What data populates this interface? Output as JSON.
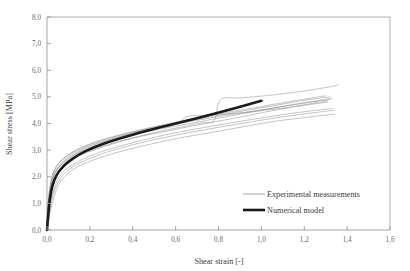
{
  "chart_data": {
    "type": "line",
    "title": "",
    "xlabel": "Shear strain [-]",
    "ylabel": "Shear stress [MPa]",
    "xlim": [
      0.0,
      1.6
    ],
    "ylim": [
      0.0,
      8.0
    ],
    "xticks": [
      0.0,
      0.2,
      0.4,
      0.6,
      0.8,
      1.0,
      1.2,
      1.4,
      1.6
    ],
    "yticks": [
      0.0,
      1.0,
      2.0,
      3.0,
      4.0,
      5.0,
      6.0,
      7.0,
      8.0
    ],
    "xtick_labels": [
      "0,0",
      "0,2",
      "0,4",
      "0,6",
      "0,8",
      "1,0",
      "1,2",
      "1,4",
      "1,6"
    ],
    "ytick_labels": [
      "0,0",
      "1,0",
      "2,0",
      "3,0",
      "4,0",
      "5,0",
      "6,0",
      "7,0",
      "8,0"
    ],
    "grid": false,
    "legend_position": "inside-lower-right",
    "decimal_separator": ",",
    "series": [
      {
        "name": "Experimental measurements",
        "style": "thin",
        "color": "#808080",
        "width": 0.6,
        "curves": [
          {
            "id": "exp-1",
            "x": [
              0.0,
              0.004,
              0.01,
              0.02,
              0.035,
              0.06,
              0.1,
              0.16,
              0.25,
              0.38,
              0.52,
              0.68,
              0.84,
              1.0,
              1.14,
              1.26,
              1.33
            ],
            "y": [
              0.0,
              0.55,
              1.15,
              1.7,
              2.1,
              2.4,
              2.68,
              2.95,
              3.22,
              3.52,
              3.78,
              4.02,
              4.26,
              4.5,
              4.7,
              4.86,
              4.95
            ]
          },
          {
            "id": "exp-2",
            "x": [
              0.0,
              0.005,
              0.012,
              0.024,
              0.042,
              0.07,
              0.11,
              0.17,
              0.27,
              0.4,
              0.55,
              0.7,
              0.86,
              1.0,
              1.13,
              1.24,
              1.31
            ],
            "y": [
              0.0,
              0.5,
              1.05,
              1.6,
              2.0,
              2.3,
              2.58,
              2.86,
              3.14,
              3.45,
              3.7,
              3.94,
              4.18,
              4.4,
              4.6,
              4.76,
              4.85
            ]
          },
          {
            "id": "exp-3",
            "x": [
              0.0,
              0.003,
              0.008,
              0.018,
              0.032,
              0.055,
              0.095,
              0.15,
              0.24,
              0.36,
              0.5,
              0.66,
              0.82,
              0.98,
              1.12,
              1.24,
              1.32
            ],
            "y": [
              0.0,
              0.62,
              1.25,
              1.8,
              2.2,
              2.5,
              2.78,
              3.04,
              3.32,
              3.6,
              3.86,
              4.1,
              4.34,
              4.56,
              4.76,
              4.92,
              5.0
            ]
          },
          {
            "id": "exp-4",
            "x": [
              0.0,
              0.006,
              0.015,
              0.03,
              0.05,
              0.08,
              0.13,
              0.2,
              0.3,
              0.44,
              0.58,
              0.74,
              0.9,
              1.04,
              1.16,
              1.26,
              1.33
            ],
            "y": [
              0.0,
              0.45,
              0.95,
              1.5,
              1.9,
              2.22,
              2.5,
              2.78,
              3.06,
              3.36,
              3.62,
              3.86,
              4.08,
              4.26,
              4.4,
              4.5,
              4.56
            ]
          },
          {
            "id": "exp-5",
            "x": [
              0.0,
              0.008,
              0.02,
              0.038,
              0.06,
              0.09,
              0.14,
              0.22,
              0.33,
              0.47,
              0.62,
              0.78,
              0.93,
              1.06,
              1.18,
              1.28,
              1.34
            ],
            "y": [
              0.0,
              0.38,
              0.85,
              1.38,
              1.78,
              2.08,
              2.36,
              2.64,
              2.92,
              3.2,
              3.46,
              3.68,
              3.9,
              4.08,
              4.2,
              4.3,
              4.35
            ]
          },
          {
            "id": "exp-6",
            "x": [
              0.0,
              0.004,
              0.011,
              0.022,
              0.038,
              0.065,
              0.105,
              0.165,
              0.26,
              0.39,
              0.53,
              0.62,
              0.65,
              0.72,
              0.85,
              1.0,
              1.14,
              1.25,
              1.31
            ],
            "y": [
              0.0,
              0.58,
              1.2,
              1.74,
              2.14,
              2.44,
              2.72,
              3.0,
              3.3,
              3.62,
              3.9,
              4.06,
              4.26,
              4.3,
              4.36,
              4.48,
              4.62,
              4.74,
              4.8
            ]
          },
          {
            "id": "exp-7",
            "x": [
              0.0,
              0.005,
              0.013,
              0.026,
              0.045,
              0.075,
              0.12,
              0.18,
              0.28,
              0.42,
              0.56,
              0.72,
              0.78,
              0.81,
              0.9,
              1.04,
              1.18,
              1.3,
              1.36
            ],
            "y": [
              0.0,
              0.52,
              1.1,
              1.66,
              2.06,
              2.36,
              2.64,
              2.92,
              3.2,
              3.5,
              3.76,
              4.02,
              4.12,
              4.9,
              4.96,
              5.06,
              5.2,
              5.35,
              5.45
            ]
          },
          {
            "id": "exp-8",
            "x": [
              0.0,
              0.004,
              0.01,
              0.021,
              0.036,
              0.062,
              0.1,
              0.158,
              0.25,
              0.37,
              0.51,
              0.67,
              0.83,
              0.99,
              1.13,
              1.25,
              1.32
            ],
            "y": [
              0.0,
              0.6,
              1.22,
              1.77,
              2.17,
              2.47,
              2.75,
              3.02,
              3.3,
              3.58,
              3.84,
              4.08,
              4.3,
              4.5,
              4.68,
              4.82,
              4.9
            ]
          },
          {
            "id": "exp-9",
            "x": [
              0.0,
              0.007,
              0.017,
              0.033,
              0.055,
              0.085,
              0.135,
              0.21,
              0.31,
              0.45,
              0.6,
              0.76,
              0.92,
              1.06,
              1.18,
              1.28,
              1.34
            ],
            "y": [
              0.0,
              0.42,
              0.9,
              1.44,
              1.84,
              2.15,
              2.44,
              2.72,
              3.0,
              3.3,
              3.56,
              3.8,
              4.02,
              4.2,
              4.34,
              4.44,
              4.5
            ]
          },
          {
            "id": "exp-10",
            "x": [
              0.0,
              0.003,
              0.009,
              0.019,
              0.034,
              0.058,
              0.098,
              0.155,
              0.245,
              0.37,
              0.5,
              0.64,
              0.8,
              0.96,
              1.1,
              1.22,
              1.3
            ],
            "y": [
              0.0,
              0.65,
              1.3,
              1.84,
              2.24,
              2.54,
              2.82,
              3.08,
              3.36,
              3.64,
              3.88,
              4.12,
              4.36,
              4.58,
              4.78,
              4.94,
              5.04
            ]
          }
        ]
      },
      {
        "name": "Numerical model",
        "style": "thick",
        "color": "#1a1a1a",
        "width": 2.6,
        "curves": [
          {
            "id": "num-1",
            "x": [
              0.0,
              0.005,
              0.012,
              0.025,
              0.045,
              0.075,
              0.12,
              0.18,
              0.27,
              0.4,
              0.55,
              0.7,
              0.85,
              1.0
            ],
            "y": [
              0.0,
              0.5,
              1.08,
              1.65,
              2.06,
              2.38,
              2.68,
              2.96,
              3.26,
              3.58,
              3.9,
              4.2,
              4.52,
              4.85
            ]
          }
        ]
      }
    ]
  },
  "legend": {
    "items": [
      {
        "label": "Experimental measurements",
        "style": "thin"
      },
      {
        "label": "Numerical model",
        "style": "thick"
      }
    ]
  },
  "colors": {
    "background": "#ffffff",
    "axis": "#9a9a9a",
    "tick_text": "#6a6a6a",
    "axis_title": "#3a3a3a",
    "experimental": "#808080",
    "numerical": "#1a1a1a"
  }
}
